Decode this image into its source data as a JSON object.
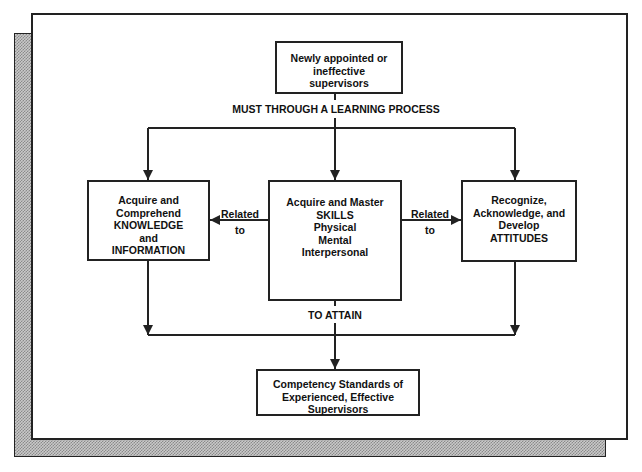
{
  "diagram": {
    "colors": {
      "line": "#222222",
      "text": "#111111",
      "background": "#ffffff",
      "shadow": "#8a8a8a"
    },
    "nodes": {
      "start": {
        "lines": [
          "Newly appointed or",
          "ineffective",
          "supervisors"
        ]
      },
      "knowledge": {
        "lines": [
          "Acquire and",
          "Comprehend",
          "KNOWLEDGE",
          "and",
          "INFORMATION"
        ]
      },
      "skills": {
        "lines": [
          "Acquire and Master",
          "SKILLS",
          "Physical",
          "Mental",
          "Interpersonal"
        ]
      },
      "attitudes": {
        "lines": [
          "Recognize,",
          "Acknowledge, and",
          "Develop",
          "ATTITUDES"
        ]
      },
      "goal": {
        "lines": [
          "Competency Standards of",
          "Experienced, Effective",
          "Supervisors"
        ]
      }
    },
    "edge_labels": {
      "process": "MUST THROUGH A LEARNING PROCESS",
      "attain": "TO ATTAIN",
      "related_left": [
        "Related",
        "to"
      ],
      "related_right": [
        "Related",
        "to"
      ]
    },
    "edges": [
      {
        "from": "start",
        "to": [
          "knowledge",
          "skills",
          "attitudes"
        ],
        "label": "MUST THROUGH A LEARNING PROCESS"
      },
      {
        "from": "knowledge",
        "to": "skills",
        "bidirectional": true,
        "label": "Related to"
      },
      {
        "from": "skills",
        "to": "attitudes",
        "bidirectional": true,
        "label": "Related to"
      },
      {
        "from": [
          "knowledge",
          "skills",
          "attitudes"
        ],
        "to": "goal",
        "label": "TO ATTAIN"
      }
    ]
  }
}
